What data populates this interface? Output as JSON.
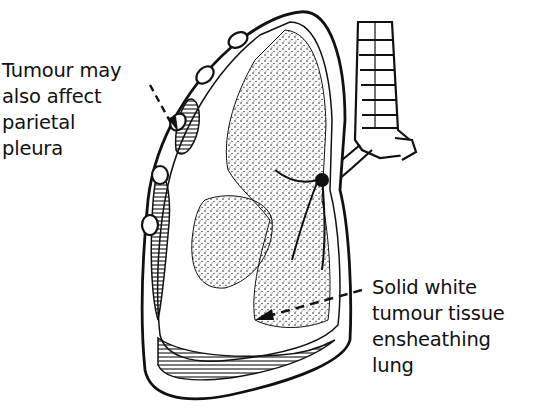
{
  "diagram": {
    "labels": {
      "parietal": {
        "lines": [
          "Tumour may",
          "also affect",
          "parietal",
          "pleura"
        ]
      },
      "ensheathing": {
        "lines": [
          "Solid white",
          "tumour tissue",
          "ensheathing",
          "lung"
        ]
      }
    },
    "colors": {
      "ink": "#111111",
      "background": "#ffffff",
      "stipple": "#222222"
    }
  }
}
